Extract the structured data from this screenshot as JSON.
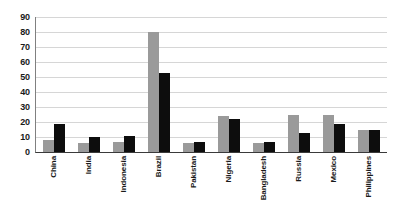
{
  "chart_data": {
    "type": "bar",
    "title": "",
    "subtitle": "",
    "xlabel": "",
    "ylabel": "",
    "ylim": [
      0,
      90
    ],
    "ytick_step": 10,
    "yticks": [
      90,
      80,
      70,
      60,
      50,
      40,
      30,
      20,
      10,
      0
    ],
    "grid": true,
    "legend": "none",
    "categories": [
      "China",
      "India",
      "Indonesia",
      "Brazil",
      "Pakistan",
      "Nigeria",
      "Bangladesh",
      "Russia",
      "Mexico",
      "Philippines"
    ],
    "series": [
      {
        "name": "series-1",
        "color": "#9a9a9a",
        "values": [
          8,
          6,
          7,
          80,
          6,
          24,
          6,
          25,
          25,
          15
        ]
      },
      {
        "name": "series-2",
        "color": "#0d0d0d",
        "values": [
          19,
          10,
          11,
          53,
          7,
          22,
          7,
          13,
          19,
          15
        ]
      }
    ]
  },
  "colors": {
    "background": "#ffffff",
    "gridline": "#d6d6d6",
    "axis": "#3a3a3a",
    "series_a": "#9a9a9a",
    "series_b": "#0d0d0d",
    "text": "#1a1a1a"
  }
}
